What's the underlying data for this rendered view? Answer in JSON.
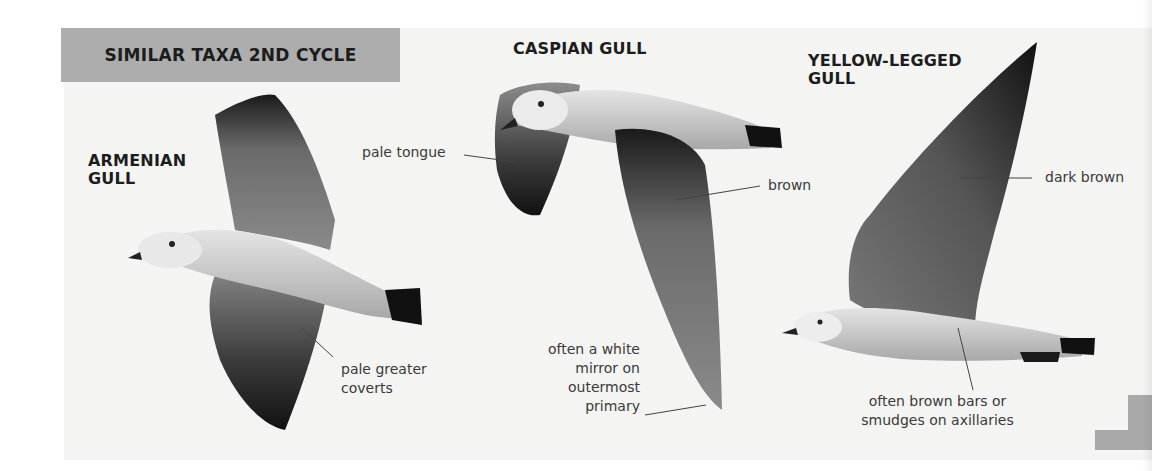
{
  "header": {
    "title": "SIMILAR TAXA 2ND CYCLE",
    "background_color": "#adadad"
  },
  "birds": [
    {
      "name": "ARMENIAN GULL",
      "name_lines": [
        "ARMENIAN",
        "GULL"
      ],
      "annotations": [
        {
          "lines": [
            "pale greater",
            "coverts"
          ]
        }
      ]
    },
    {
      "name": "CASPIAN GULL",
      "name_lines": [
        "CASPIAN GULL"
      ],
      "annotations": [
        {
          "lines": [
            "pale tongue"
          ]
        },
        {
          "lines": [
            "brown"
          ]
        },
        {
          "lines": [
            "often a white",
            "mirror on",
            "outermost",
            "primary"
          ]
        }
      ]
    },
    {
      "name": "YELLOW-LEGGED GULL",
      "name_lines": [
        "YELLOW-LEGGED",
        "GULL"
      ],
      "annotations": [
        {
          "lines": [
            "dark brown"
          ]
        },
        {
          "lines": [
            "often brown bars or",
            "smudges on axillaries"
          ]
        }
      ]
    }
  ],
  "colors": {
    "page_background": "#ffffff",
    "photo_background": "#f4f4f3",
    "text": "#1d1d1d",
    "annotation_text": "#3a3a3a",
    "corner_mark": "#a9a9a9"
  }
}
